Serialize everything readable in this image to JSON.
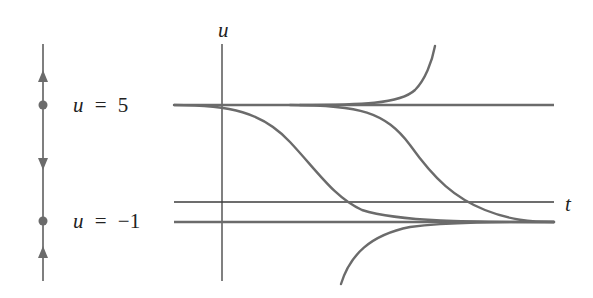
{
  "figure": {
    "colors": {
      "curve": "#6b6b6b",
      "axis": "#3c3c3c",
      "text": "#222222"
    }
  },
  "phase_line": {
    "equilibria": [
      {
        "label_var": "u",
        "label_eq": "=",
        "label_val": "5",
        "value": 5,
        "stability": "unstable"
      },
      {
        "label_var": "u",
        "label_eq": "=",
        "label_val": "−1",
        "value": -1,
        "stability": "stable"
      }
    ],
    "arrows": [
      {
        "region": "u > 5",
        "direction": "up"
      },
      {
        "region": "-1 < u < 5",
        "direction": "down"
      },
      {
        "region": "u < -1",
        "direction": "up"
      }
    ]
  },
  "plot": {
    "vertical_axis_label": "u",
    "horizontal_axis_label": "t",
    "equilibrium_lines": [
      5,
      -1
    ],
    "solution_curves": [
      {
        "name": "above-u5",
        "behavior": "departs u=5 and grows upward"
      },
      {
        "name": "between-1",
        "behavior": "leaves u=5 near t=0, decreases to u=-1"
      },
      {
        "name": "between-2",
        "behavior": "leaves u=5 later, decreases to u=-1"
      },
      {
        "name": "below-u-1",
        "behavior": "rises from below toward u=-1"
      }
    ]
  }
}
